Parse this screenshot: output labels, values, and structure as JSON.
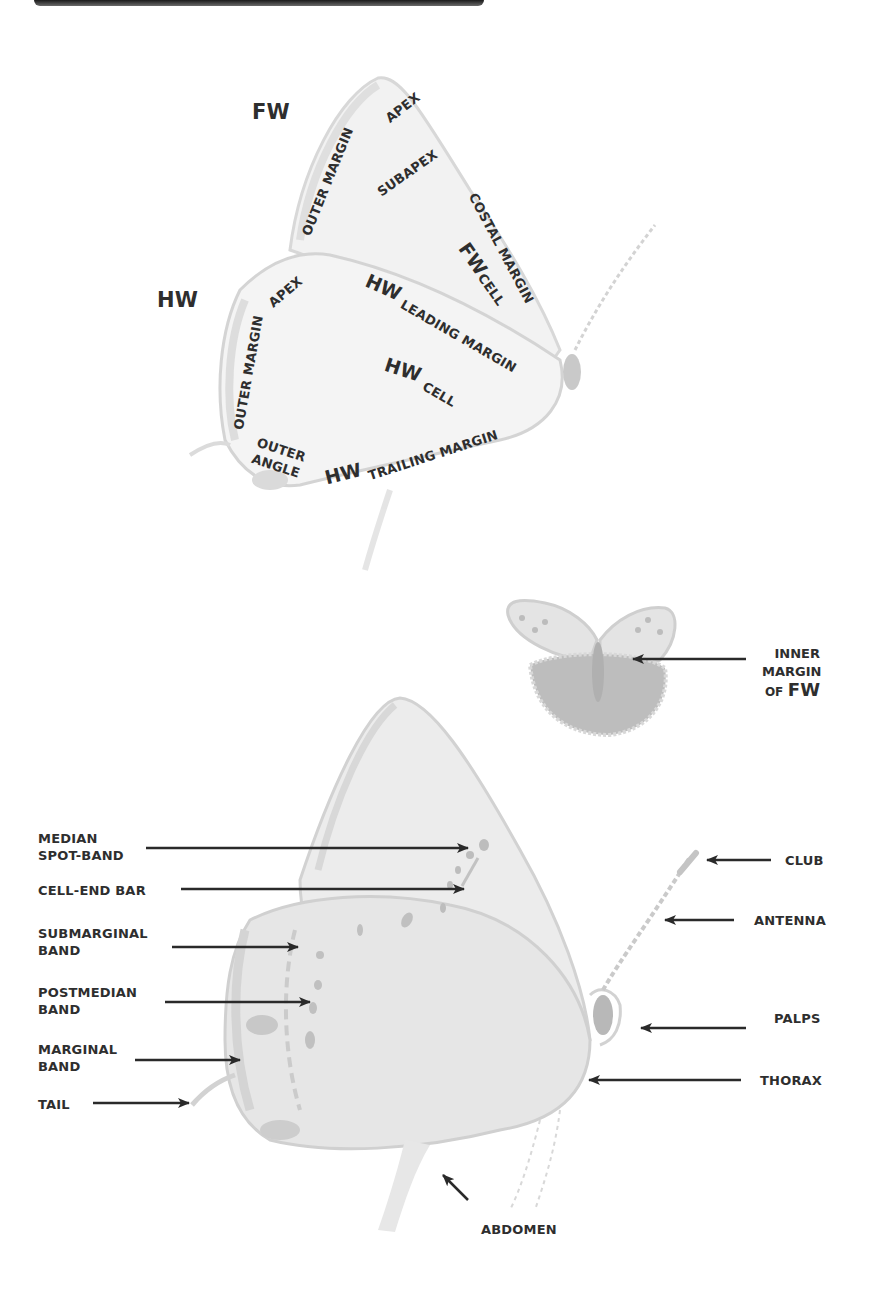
{
  "figure": {
    "type": "butterfly-anatomy-diagram",
    "colors": {
      "text": "#2e2e2e",
      "arrow": "#2a2a2a",
      "wing_fill": "#e9e9e9",
      "wing_edge": "#cfcfcf",
      "spot": "#b9b9b9"
    }
  },
  "top_diagram": {
    "fw_label": "FW",
    "hw_label": "HW",
    "fw_regions": {
      "apex": "APEX",
      "outer_margin": "OUTER MARGIN",
      "subapex": "SUBAPEX",
      "costal_margin": "COSTAL MARGIN",
      "cell_prefix": "FW",
      "cell": "CELL"
    },
    "hw_regions": {
      "apex": "APEX",
      "outer_margin": "OUTER MARGIN",
      "leading_prefix": "HW",
      "leading_margin": "LEADING MARGIN",
      "cell_prefix": "HW",
      "cell": "CELL",
      "outer_angle": "OUTER\nANGLE",
      "trailing_prefix": "HW",
      "trailing_margin": "TRAILING MARGIN"
    }
  },
  "middle_diagram": {
    "label_line1": "INNER",
    "label_line2": "MARGIN",
    "label_of": "OF",
    "label_fw": "FW"
  },
  "bottom_diagram": {
    "left_labels": [
      {
        "text": "MEDIAN\nSPOT-BAND"
      },
      {
        "text": "CELL-END BAR"
      },
      {
        "text": "SUBMARGINAL\nBAND"
      },
      {
        "text": "POSTMEDIAN\nBAND"
      },
      {
        "text": "MARGINAL\nBAND"
      },
      {
        "text": "TAIL"
      }
    ],
    "right_labels": [
      {
        "text": "CLUB"
      },
      {
        "text": "ANTENNA"
      },
      {
        "text": "PALPS"
      },
      {
        "text": "THORAX"
      }
    ],
    "bottom_label": "ABDOMEN"
  }
}
